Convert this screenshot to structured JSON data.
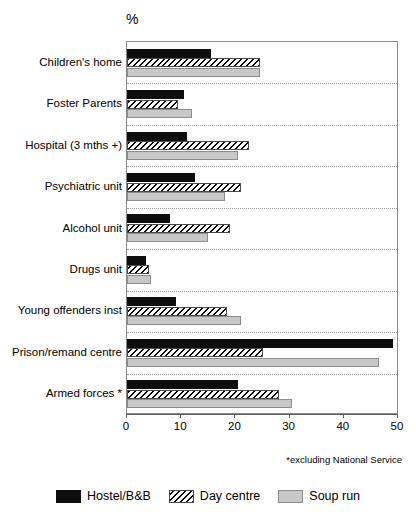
{
  "chart_data": {
    "type": "bar",
    "orientation": "horizontal",
    "title": "",
    "xlabel": "",
    "ylabel": "",
    "unit_label": "%",
    "xlim": [
      0,
      50
    ],
    "xticks": [
      0,
      10,
      20,
      30,
      40,
      50
    ],
    "xtick_labels": [
      "0",
      "10",
      "20",
      "30",
      "40",
      "50"
    ],
    "grid": "dotted horizontal separators between categories",
    "legend_position": "bottom-center",
    "footnote": "*excluding National Service",
    "categories": [
      "Children's home",
      "Foster Parents",
      "Hospital (3 mths +)",
      "Psychiatric unit",
      "Alcohol unit",
      "Drugs unit",
      "Young offenders inst",
      "Prison/remand centre",
      "Armed forces *"
    ],
    "series": [
      {
        "name": "Hostel/B&B",
        "color": "#0d0d0d",
        "values": [
          15.5,
          10.5,
          11,
          12.5,
          8,
          3.5,
          9,
          49,
          20.5
        ]
      },
      {
        "name": "Day centre",
        "color": "#ffffff",
        "pattern": "diagonal-hatch",
        "values": [
          24.5,
          9.5,
          22.5,
          21,
          19,
          4,
          18.5,
          25,
          28
        ]
      },
      {
        "name": "Soup run",
        "color": "#c8c8c8",
        "values": [
          24.5,
          12,
          20.5,
          18,
          15,
          4.5,
          21,
          46.5,
          30.5
        ]
      }
    ]
  }
}
